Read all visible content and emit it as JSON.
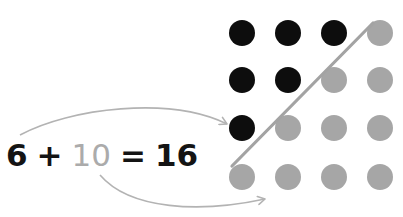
{
  "equation": {
    "addend_black": "6",
    "plus": "+",
    "addend_grey": "10",
    "equals": "=",
    "sum": "16"
  },
  "colors": {
    "black_dot": "#0d0d0d",
    "grey_dot": "#a6a6a6",
    "grey_text": "#ababab",
    "arrow": "#b3b3b3",
    "divider_line": "#a3a3a3",
    "text": "#141414"
  },
  "grid": {
    "rows": 4,
    "cols": 4,
    "black_count": 6,
    "grey_count": 10,
    "dots": [
      [
        "black",
        "black",
        "black",
        "grey"
      ],
      [
        "black",
        "black",
        "grey",
        "grey"
      ],
      [
        "black",
        "grey",
        "grey",
        "grey"
      ],
      [
        "grey",
        "grey",
        "grey",
        "grey"
      ]
    ]
  }
}
